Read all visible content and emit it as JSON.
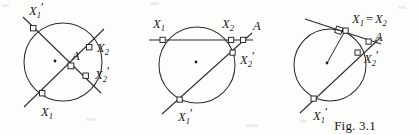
{
  "page": {
    "caption": "Fig. 3.1",
    "background_color": "#fdfdfb",
    "ink_color": "#2b2b2b"
  },
  "figures": [
    {
      "id": "case-internal",
      "description": "Two chords meeting at interior point A",
      "labels": {
        "x1_prime": {
          "base": "X",
          "sub": "1",
          "prime": "′"
        },
        "x1": {
          "base": "X",
          "sub": "1",
          "prime": ""
        },
        "x2": {
          "base": "X",
          "sub": "2",
          "prime": ""
        },
        "x2_prime": {
          "base": "X",
          "sub": "2",
          "prime": "′"
        },
        "a": {
          "base": "A",
          "sub": "",
          "prime": ""
        }
      }
    },
    {
      "id": "case-external",
      "description": "Two secants meeting at exterior point A",
      "labels": {
        "x1": {
          "base": "X",
          "sub": "1",
          "prime": ""
        },
        "x2": {
          "base": "X",
          "sub": "2",
          "prime": ""
        },
        "a": {
          "base": "A",
          "sub": "",
          "prime": ""
        },
        "x2_prime": {
          "base": "X",
          "sub": "2",
          "prime": "′"
        },
        "x1_prime": {
          "base": "X",
          "sub": "1",
          "prime": "′"
        }
      }
    },
    {
      "id": "case-tangent",
      "description": "Tangent line, contact point where X1 coincides with X2",
      "labels": {
        "x1_eq_x2": {
          "left": "X",
          "left_sub": "1",
          "eq": "=",
          "right": "X",
          "right_sub": "2"
        },
        "a": {
          "base": "A",
          "sub": "",
          "prime": ""
        },
        "x2_prime": {
          "base": "X",
          "sub": "2",
          "prime": "′"
        },
        "x1_prime": {
          "base": "X",
          "sub": "1",
          "prime": "′"
        }
      }
    }
  ]
}
